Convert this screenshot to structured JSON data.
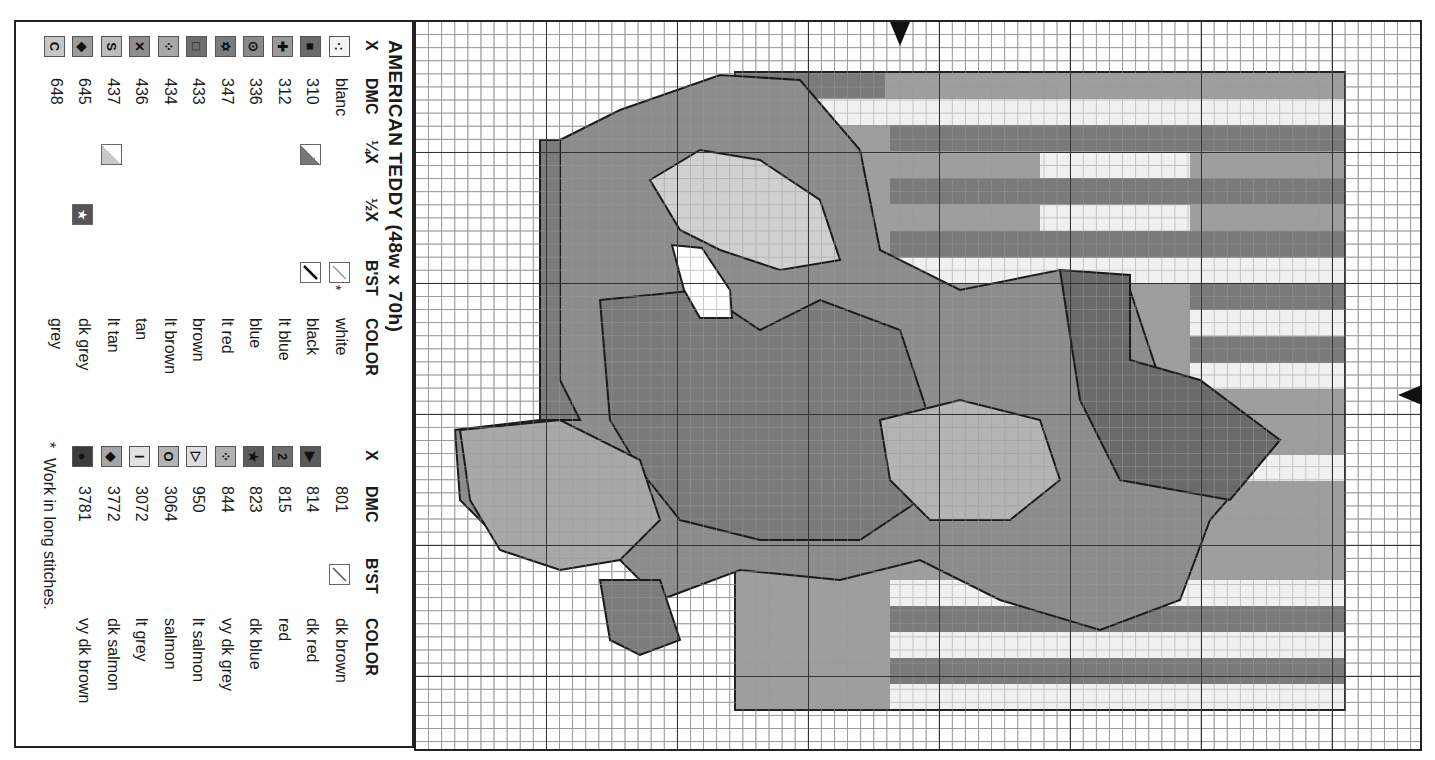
{
  "legend": {
    "title": "AMERICAN TEDDY (48w x 70h)",
    "headers_left": {
      "x": "X",
      "dmc": "DMC",
      "quarter": "¼X",
      "half": "½X",
      "bst": "B'ST",
      "color": "COLOR"
    },
    "headers_right": {
      "x": "X",
      "dmc": "DMC",
      "bst": "B'ST",
      "color": "COLOR"
    },
    "left_rows": [
      {
        "symbol": "·:",
        "dmc": "blanc",
        "color": "white",
        "fill": "#f4f4f4",
        "bst": "light-diagonal",
        "bst_note": "*"
      },
      {
        "symbol": "■",
        "dmc": "310",
        "color": "black",
        "fill": "#6a6a6a",
        "quarter": "dark-half",
        "bst": "dark-diagonal"
      },
      {
        "symbol": "✚",
        "dmc": "312",
        "color": "lt blue",
        "fill": "#9a9a9a"
      },
      {
        "symbol": "⊙",
        "dmc": "336",
        "color": "blue",
        "fill": "#8a8a8a"
      },
      {
        "symbol": "✡",
        "dmc": "347",
        "color": "lt red",
        "fill": "#7c7c7c"
      },
      {
        "symbol": "□",
        "dmc": "433",
        "color": "brown",
        "fill": "#6e6e6e"
      },
      {
        "symbol": "⁘",
        "dmc": "434",
        "color": "lt brown",
        "fill": "#a8a8a8"
      },
      {
        "symbol": "✕",
        "dmc": "436",
        "color": "tan",
        "fill": "#8e8e8e"
      },
      {
        "symbol": "S",
        "dmc": "437",
        "color": "lt tan",
        "fill": "#bdbdbd",
        "quarter": "light-half"
      },
      {
        "symbol": "◆",
        "dmc": "645",
        "color": "dk grey",
        "fill": "#9c9c9c",
        "half": "star-dark"
      },
      {
        "symbol": "C",
        "dmc": "648",
        "color": "grey",
        "fill": "#c6c6c6"
      }
    ],
    "right_rows": [
      {
        "symbol": "",
        "dmc": "801",
        "color": "dk brown",
        "bst": "mid-diagonal"
      },
      {
        "symbol": "▶",
        "dmc": "814",
        "color": "dk red",
        "fill": "#5a5a5a"
      },
      {
        "symbol": "2",
        "dmc": "815",
        "color": "red",
        "fill": "#6e6e6e"
      },
      {
        "symbol": "★",
        "dmc": "823",
        "color": "dk blue",
        "fill": "#5c5c5c"
      },
      {
        "symbol": "⁘",
        "dmc": "844",
        "color": "vy dk grey",
        "fill": "#b0b0b0"
      },
      {
        "symbol": "▷",
        "dmc": "950",
        "color": "lt salmon",
        "fill": "#dedede"
      },
      {
        "symbol": "O",
        "dmc": "3064",
        "color": "salmon",
        "fill": "#b4b4b4"
      },
      {
        "symbol": "I",
        "dmc": "3072",
        "color": "lt grey",
        "fill": "#e2e2e2"
      },
      {
        "symbol": "◆",
        "dmc": "3772",
        "color": "dk salmon",
        "fill": "#a6a6a6"
      },
      {
        "symbol": "●",
        "dmc": "3781",
        "color": "vy dk brown",
        "fill": "#3c3c3c"
      }
    ],
    "footnote_mark": "*",
    "footnote": "Work in long stitches."
  },
  "chart": {
    "grid_cell_px": 13.1,
    "major_every": 10,
    "center_markers": [
      "top",
      "right"
    ],
    "regions": [
      {
        "name": "flag-field",
        "fill": "#9e9e9e",
        "x": 735,
        "y": 72,
        "w": 610,
        "h": 638
      },
      {
        "name": "stripe-white-1",
        "fill": "#f0f0f0",
        "x": 800,
        "y": 99,
        "w": 545,
        "h": 26
      },
      {
        "name": "stripe-white-2",
        "fill": "#f0f0f0",
        "x": 1040,
        "y": 152,
        "w": 150,
        "h": 26
      },
      {
        "name": "stripe-white-3",
        "fill": "#f0f0f0",
        "x": 1040,
        "y": 205,
        "w": 150,
        "h": 26
      },
      {
        "name": "stripe-white-4",
        "fill": "#f0f0f0",
        "x": 890,
        "y": 258,
        "w": 455,
        "h": 26
      },
      {
        "name": "stripe-white-5",
        "fill": "#f0f0f0",
        "x": 1190,
        "y": 310,
        "w": 155,
        "h": 26
      },
      {
        "name": "stripe-white-6",
        "fill": "#f0f0f0",
        "x": 1190,
        "y": 363,
        "w": 155,
        "h": 26
      },
      {
        "name": "stripe-white-7",
        "fill": "#f0f0f0",
        "x": 1100,
        "y": 455,
        "w": 245,
        "h": 26
      },
      {
        "name": "stripe-white-8",
        "fill": "#f0f0f0",
        "x": 890,
        "y": 580,
        "w": 455,
        "h": 26
      },
      {
        "name": "stripe-white-9",
        "fill": "#f0f0f0",
        "x": 890,
        "y": 632,
        "w": 455,
        "h": 26
      },
      {
        "name": "stripe-white-10",
        "fill": "#f0f0f0",
        "x": 890,
        "y": 684,
        "w": 455,
        "h": 26
      },
      {
        "name": "stripe-red-1",
        "fill": "#7a7a7a",
        "x": 735,
        "y": 72,
        "w": 150,
        "h": 26
      },
      {
        "name": "stripe-red-2",
        "fill": "#7a7a7a",
        "x": 890,
        "y": 125,
        "w": 455,
        "h": 26
      },
      {
        "name": "stripe-red-3",
        "fill": "#7a7a7a",
        "x": 890,
        "y": 178,
        "w": 455,
        "h": 26
      },
      {
        "name": "stripe-red-4",
        "fill": "#7a7a7a",
        "x": 890,
        "y": 231,
        "w": 455,
        "h": 26
      },
      {
        "name": "stripe-red-5",
        "fill": "#7a7a7a",
        "x": 1190,
        "y": 284,
        "w": 155,
        "h": 26
      },
      {
        "name": "stripe-red-6",
        "fill": "#7a7a7a",
        "x": 1190,
        "y": 337,
        "w": 155,
        "h": 26
      },
      {
        "name": "stripe-red-7",
        "fill": "#7a7a7a",
        "x": 890,
        "y": 606,
        "w": 455,
        "h": 26
      },
      {
        "name": "stripe-red-8",
        "fill": "#7a7a7a",
        "x": 890,
        "y": 658,
        "w": 455,
        "h": 26
      }
    ],
    "bear": [
      {
        "name": "bear-body",
        "fill": "#8c8c8c",
        "points": "560,140 620,110 720,75 800,80 860,150 880,250 960,290 1060,270 1130,290 1160,380 1280,440 1210,520 1180,600 1100,630 1000,600 920,560 840,580 740,570 660,600 620,560 560,560 500,540 460,500 455,430 540,420 560,360 545,300 550,220"
      },
      {
        "name": "bear-head-shade",
        "fill": "#7a7a7a",
        "points": "600,300 700,290 760,330 820,300 900,330 930,420 920,500 860,540 760,540 680,520 640,470 610,420"
      },
      {
        "name": "bear-ear-left",
        "fill": "#a8a8a8",
        "points": "460,430 560,420 640,460 660,520 620,560 560,570 500,550 470,500"
      },
      {
        "name": "bear-arm-flag",
        "fill": "#6a6a6a",
        "points": "1060,270 1130,275 1130,360 1200,380 1280,440 1230,500 1120,480 1080,400"
      },
      {
        "name": "bear-bow",
        "fill": "#d0d0d0",
        "points": "650,180 700,150 760,160 820,200 840,260 780,270 720,250 680,230"
      },
      {
        "name": "bear-muzzle",
        "fill": "#b4b4b4",
        "points": "880,420 960,400 1040,420 1060,480 1010,520 930,520 890,480"
      },
      {
        "name": "bear-white-gap",
        "fill": "#ffffff",
        "points": "672,245 702,248 730,290 732,318 700,318 684,290"
      },
      {
        "name": "bear-foot-stars",
        "fill": "#7c7c7c",
        "points": "600,580 660,580 680,640 640,655 610,640"
      },
      {
        "name": "bear-side-stars",
        "fill": "#7c7c7c",
        "points": "540,140 560,140 560,380 580,420 540,420"
      }
    ]
  }
}
